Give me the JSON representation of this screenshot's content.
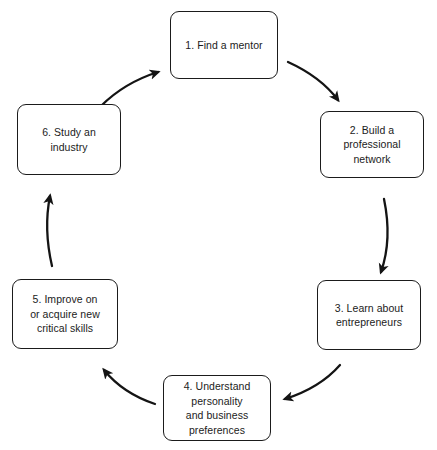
{
  "diagram": {
    "type": "cycle",
    "direction": "clockwise",
    "stroke_color": "#1b1b1b",
    "fill_color": "#ffffff",
    "text_color": "#1b1b1b",
    "nodes": [
      {
        "id": "node-1",
        "step": "1",
        "label": "1. Find a mentor"
      },
      {
        "id": "node-2",
        "step": "2",
        "label": "2. Build a\nprofessional\nnetwork"
      },
      {
        "id": "node-3",
        "step": "3",
        "label": "3. Learn about\nentrepreneurs"
      },
      {
        "id": "node-4",
        "step": "4",
        "label": "4. Understand\npersonality\nand business\npreferences"
      },
      {
        "id": "node-5",
        "step": "5",
        "label": "5. Improve on\nor acquire new\ncritical skills"
      },
      {
        "id": "node-6",
        "step": "6",
        "label": "6. Study an\nindustry"
      }
    ],
    "arrows": [
      {
        "id": "arrow-1-to-2",
        "from": "1",
        "to": "2",
        "path": "M 288 62 C 310 72 326 84 338 100"
      },
      {
        "id": "arrow-2-to-3",
        "from": "2",
        "to": "3",
        "path": "M 384 199 C 390 228 388 252 381 272"
      },
      {
        "id": "arrow-3-to-4",
        "from": "3",
        "to": "4",
        "path": "M 340 365 C 326 381 307 392 285 399"
      },
      {
        "id": "arrow-4-to-5",
        "from": "4",
        "to": "5",
        "path": "M 155 404 C 134 397 117 386 104 370"
      },
      {
        "id": "arrow-5-to-6",
        "from": "5",
        "to": "6",
        "path": "M 52 266 C 46 240 46 216 50 196"
      },
      {
        "id": "arrow-6-to-1",
        "from": "6",
        "to": "1",
        "path": "M 101 106 C 117 90 136 79 158 72"
      }
    ]
  }
}
